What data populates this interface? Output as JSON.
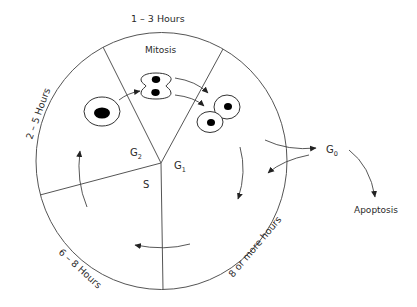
{
  "diagram": {
    "phases": {
      "mitosis": "Mitosis",
      "g2": {
        "base": "G",
        "sub": "2"
      },
      "g1": {
        "base": "G",
        "sub": "1"
      },
      "s": "S",
      "g0": {
        "base": "G",
        "sub": "0"
      }
    },
    "durations": {
      "mitosis": "1 – 3 Hours",
      "g2": "2 – 5 Hours",
      "s": "6 – 8 Hours",
      "g1": "8 or more hours"
    },
    "outcome": "Apoptosis",
    "colors": {
      "line": "#555555",
      "text": "#2a2a2a",
      "nucleus": "#000000",
      "background": "#ffffff"
    }
  }
}
